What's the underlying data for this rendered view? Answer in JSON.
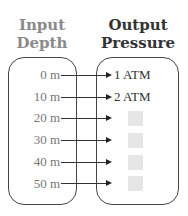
{
  "headers": {
    "input": [
      "Input",
      "Depth"
    ],
    "output": [
      "Output",
      "Pressure"
    ]
  },
  "rows": [
    {
      "depth": "0 m",
      "pressure": "1 ATM"
    },
    {
      "depth": "10 m",
      "pressure": "2 ATM"
    },
    {
      "depth": "20 m",
      "pressure": ""
    },
    {
      "depth": "30 m",
      "pressure": ""
    },
    {
      "depth": "40 m",
      "pressure": ""
    },
    {
      "depth": "50 m",
      "pressure": ""
    }
  ],
  "colors": {
    "input_header": "#8a8a8a",
    "output_header": "#333333",
    "blank_box": "#e6e6e6"
  }
}
